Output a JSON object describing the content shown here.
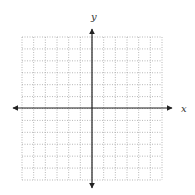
{
  "diagram": {
    "type": "coordinate-plane",
    "x_axis_label": "x",
    "y_axis_label": "y",
    "grid": {
      "columns": 12,
      "rows": 12,
      "left": 22,
      "top": 37,
      "right": 162,
      "bottom": 180,
      "line_style": "dotted",
      "line_color": "#9a9a9a"
    },
    "axes": {
      "origin_x": 92,
      "origin_y": 108,
      "x_start": 13,
      "x_end": 172,
      "y_start": 29,
      "y_end": 188,
      "color": "#222222",
      "arrows": "both-ends"
    },
    "label_positions": {
      "x": {
        "x": 181,
        "y": 112
      },
      "y": {
        "x": 91,
        "y": 20
      }
    }
  }
}
